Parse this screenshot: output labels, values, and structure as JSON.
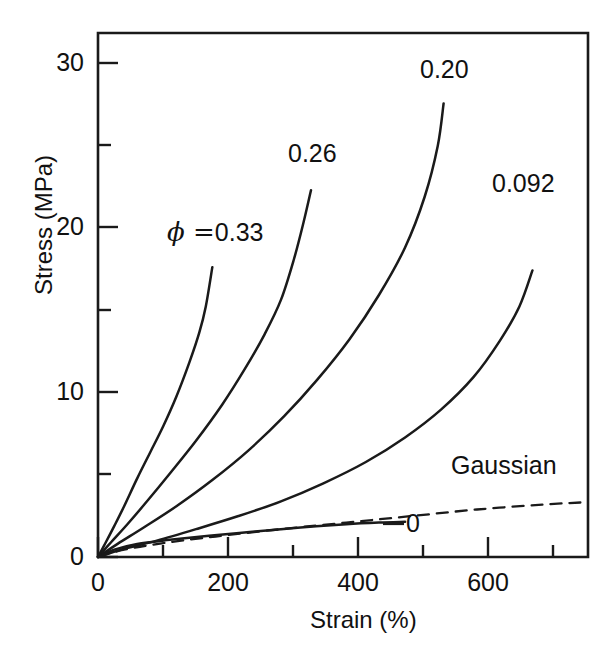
{
  "chart_data": {
    "type": "line",
    "title": "",
    "xlabel": "Strain (%)",
    "ylabel": "Stress (MPa)",
    "xlim": [
      0,
      750
    ],
    "ylim": [
      0,
      32
    ],
    "xticks_major": [
      0,
      200,
      400,
      600
    ],
    "xticks_minor": [
      100,
      300,
      500,
      700
    ],
    "yticks_major": [
      0,
      10,
      20,
      30
    ],
    "yticks_minor": [
      5,
      15,
      25
    ],
    "grid": false,
    "legend_position": "inline-curve-labels",
    "series": [
      {
        "name": "phi = 0.33",
        "label": "0.33",
        "label_prefix": "ϕ =",
        "style": "solid",
        "points": [
          [
            0,
            0
          ],
          [
            12,
            0.9
          ],
          [
            25,
            1.9
          ],
          [
            40,
            3.1
          ],
          [
            60,
            4.8
          ],
          [
            80,
            6.4
          ],
          [
            100,
            8.0
          ],
          [
            120,
            9.8
          ],
          [
            140,
            11.9
          ],
          [
            155,
            13.7
          ],
          [
            165,
            15.3
          ],
          [
            175,
            17.7
          ]
        ]
      },
      {
        "name": "phi = 0.26",
        "label": "0.26",
        "style": "solid",
        "points": [
          [
            0,
            0
          ],
          [
            20,
            0.9
          ],
          [
            45,
            2.0
          ],
          [
            75,
            3.4
          ],
          [
            110,
            5.1
          ],
          [
            150,
            7.1
          ],
          [
            190,
            9.3
          ],
          [
            225,
            11.5
          ],
          [
            255,
            13.6
          ],
          [
            280,
            15.7
          ],
          [
            300,
            18.2
          ],
          [
            315,
            20.5
          ],
          [
            326,
            22.4
          ]
        ]
      },
      {
        "name": "phi = 0.20",
        "label": "0.20",
        "style": "solid",
        "points": [
          [
            0,
            0
          ],
          [
            30,
            0.8
          ],
          [
            70,
            1.8
          ],
          [
            120,
            3.1
          ],
          [
            175,
            4.7
          ],
          [
            230,
            6.5
          ],
          [
            285,
            8.6
          ],
          [
            335,
            10.8
          ],
          [
            385,
            13.3
          ],
          [
            430,
            16.0
          ],
          [
            470,
            18.9
          ],
          [
            500,
            22.0
          ],
          [
            520,
            25.1
          ],
          [
            529,
            27.7
          ]
        ]
      },
      {
        "name": "phi = 0.092",
        "label": "0.092",
        "style": "solid",
        "points": [
          [
            0,
            0
          ],
          [
            40,
            0.5
          ],
          [
            90,
            1.0
          ],
          [
            150,
            1.7
          ],
          [
            215,
            2.5
          ],
          [
            280,
            3.4
          ],
          [
            345,
            4.5
          ],
          [
            410,
            5.8
          ],
          [
            470,
            7.3
          ],
          [
            525,
            9.0
          ],
          [
            575,
            11.0
          ],
          [
            615,
            13.2
          ],
          [
            645,
            15.3
          ],
          [
            665,
            17.5
          ]
        ]
      },
      {
        "name": "phi = 0",
        "label": "0",
        "style": "solid",
        "points": [
          [
            0,
            0
          ],
          [
            25,
            0.45
          ],
          [
            60,
            0.8
          ],
          [
            110,
            1.05
          ],
          [
            170,
            1.3
          ],
          [
            240,
            1.55
          ],
          [
            310,
            1.8
          ],
          [
            380,
            2.0
          ],
          [
            430,
            2.1
          ],
          [
            470,
            2.15
          ]
        ]
      },
      {
        "name": "Gaussian",
        "label": "Gaussian",
        "style": "dashed",
        "points": [
          [
            0,
            0
          ],
          [
            40,
            0.45
          ],
          [
            100,
            0.85
          ],
          [
            180,
            1.25
          ],
          [
            280,
            1.7
          ],
          [
            380,
            2.1
          ],
          [
            480,
            2.5
          ],
          [
            580,
            2.9
          ],
          [
            680,
            3.2
          ],
          [
            750,
            3.35
          ]
        ]
      }
    ],
    "annotations": [
      {
        "text": "ϕ = 0.33",
        "x_px": 170,
        "y_px": 234
      },
      {
        "text": "0.26",
        "x_px": 291,
        "y_px": 156
      },
      {
        "text": "0.20",
        "x_px": 423,
        "y_px": 72
      },
      {
        "text": "0.092",
        "x_px": 497,
        "y_px": 186
      },
      {
        "text": "0",
        "x_px": 409,
        "y_px": 517
      },
      {
        "text": "Gaussian",
        "x_px": 454,
        "y_px": 467
      }
    ]
  },
  "axes": {
    "ylabel": "Stress (MPa)",
    "xlabel": "Strain (%)",
    "ytick_labels": [
      "30",
      "20",
      "10",
      "0"
    ],
    "xtick_labels": [
      "0",
      "200",
      "400",
      "600"
    ]
  },
  "labels": {
    "phi_prefix": "ϕ =",
    "phi_033": "0.33",
    "phi_026": "0.26",
    "phi_020": "0.20",
    "phi_0092": "0.092",
    "phi_0": "0",
    "gaussian": "Gaussian"
  },
  "colors": {
    "line": "#1a1a1a",
    "text": "#111111",
    "background": "#ffffff"
  }
}
